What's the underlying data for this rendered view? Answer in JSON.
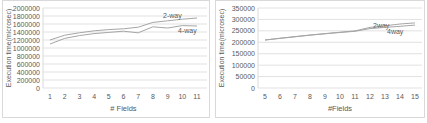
{
  "chart_data": [
    {
      "type": "line",
      "title": "",
      "xlabel": "# Fields",
      "ylabel": "Execution time(microsec)",
      "x": [
        1,
        2,
        3,
        4,
        5,
        6,
        7,
        8,
        9,
        10,
        11
      ],
      "ylim": [
        0,
        2000000
      ],
      "yticks": [
        0,
        200000,
        400000,
        600000,
        800000,
        1000000,
        1200000,
        1400000,
        1600000,
        1800000,
        2000000
      ],
      "grid": true,
      "legend_position": "inline labels at line ends",
      "series": [
        {
          "name": "2-way",
          "values": [
            1200000,
            1320000,
            1380000,
            1430000,
            1460000,
            1480000,
            1520000,
            1640000,
            1680000,
            1720000,
            1750000
          ]
        },
        {
          "name": "4-way",
          "values": [
            1100000,
            1240000,
            1310000,
            1360000,
            1390000,
            1420000,
            1380000,
            1530000,
            1500000,
            1560000,
            1550000
          ]
        }
      ]
    },
    {
      "type": "line",
      "title": "",
      "xlabel": "#Fields",
      "ylabel": "Execution time(microsec)",
      "x": [
        5,
        6,
        7,
        8,
        9,
        10,
        11,
        12,
        13,
        14,
        15
      ],
      "ylim": [
        0,
        350000
      ],
      "yticks": [
        0,
        50000,
        100000,
        150000,
        200000,
        250000,
        300000,
        350000
      ],
      "grid": true,
      "legend_position": "inline labels at line ends",
      "series": [
        {
          "name": "2way",
          "values": [
            210000,
            218000,
            225000,
            232000,
            238000,
            244000,
            250000,
            265000,
            272000,
            280000,
            285000
          ]
        },
        {
          "name": "4way",
          "values": [
            210000,
            217000,
            224000,
            231000,
            237000,
            243000,
            248000,
            260000,
            265000,
            270000,
            275000
          ]
        }
      ]
    }
  ],
  "colors": {
    "line": "#a6a6a6",
    "grid": "#d9d9d9",
    "text": "#595959"
  }
}
